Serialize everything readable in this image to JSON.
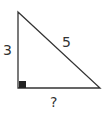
{
  "diagram": {
    "type": "right-triangle",
    "labels": {
      "vertical_leg": "3",
      "hypotenuse": "5",
      "horizontal_leg": "?"
    },
    "right_angle_marker": "filled-square",
    "colors": {
      "stroke": "#333333",
      "marker": "#222222",
      "background": "#ffffff"
    }
  }
}
